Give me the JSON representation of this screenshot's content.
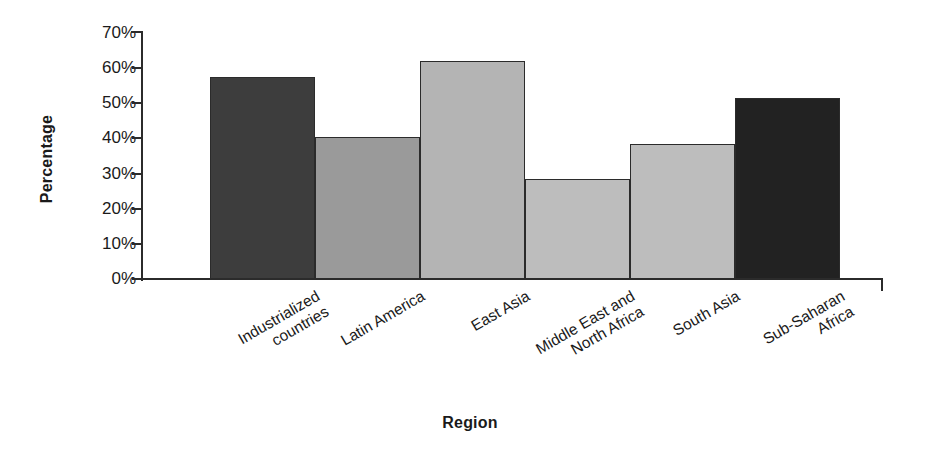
{
  "chart_data": {
    "type": "bar",
    "title": "",
    "xlabel": "Region",
    "ylabel": "Percentage",
    "categories": [
      "Industrialized\ncountries",
      "Latin America",
      "East Asia",
      "Middle East and\nNorth Africa",
      "South Asia",
      "Sub-Saharan\nAfrica"
    ],
    "values": [
      57.5,
      40.5,
      62.0,
      28.5,
      38.5,
      51.5
    ],
    "value_labels": [
      "57.5%",
      "40.5%",
      "62%",
      "28.5%",
      "38.5%",
      "51.5%"
    ],
    "ylim": [
      0,
      70
    ],
    "ytick_values": [
      0,
      10,
      20,
      30,
      40,
      50,
      60,
      70
    ],
    "ytick_labels": [
      "0%",
      "10%",
      "20%",
      "30%",
      "40%",
      "50%",
      "60%",
      "70%"
    ],
    "grid": false,
    "legend": "none",
    "bar_colors": [
      "#3d3d3d",
      "#9a9a9a",
      "#b4b4b4",
      "#bdbdbd",
      "#bdbdbd",
      "#222222"
    ],
    "bar_border_color": "#2b2b2b",
    "axis_color": "#2b2b2b",
    "background_color": "#ffffff"
  }
}
